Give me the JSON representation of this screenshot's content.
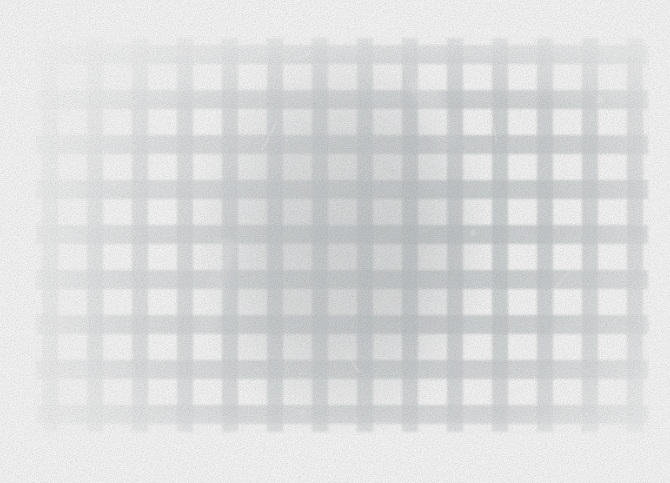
{
  "image": {
    "kind": "photograph",
    "subject": "faded overexposed photograph of a lattice / gingham grid with a large dark circular form behind it",
    "width": 670,
    "height": 483,
    "background_color": "#ffffff",
    "overall_tone": "very high-key, bleached, low contrast",
    "alt_text": "Heavily faded photograph showing a pale grey checkered lattice grid over a large soft dark circle"
  },
  "palette": {
    "paper": "#fdfdfd",
    "bar": "#b9bec1",
    "bar_light": "#dfe2e4",
    "blob_core": "#9ba0a3",
    "blob_edge": "#cdd1d4",
    "highlight": "#ffffff"
  },
  "blob": {
    "name": "dark-circular-form",
    "center_x": 340,
    "center_y": 238,
    "radius_x": 160,
    "radius_y": 205,
    "opacity": 0.62
  },
  "lattice": {
    "bar_color": "#b9bec1",
    "bar_opacity": 0.72,
    "vertical": {
      "count": 14,
      "start_x": 42,
      "period": 45,
      "width": 16,
      "top": 38,
      "bottom": 432
    },
    "horizontal": {
      "count": 9,
      "start_y": 45,
      "period": 45,
      "height": 19,
      "left": 36,
      "right": 648
    }
  },
  "crop": {
    "left": 34,
    "right": 650,
    "top": 36,
    "bottom": 434
  },
  "artifacts": {
    "streaks": [
      {
        "name": "diagonal-emulsion-streak",
        "x": 430,
        "y": 72,
        "width": 26,
        "height": 120,
        "rotate": -24,
        "opacity": 0.5
      },
      {
        "name": "diagonal-emulsion-streak",
        "x": 203,
        "y": 238,
        "width": 18,
        "height": 150,
        "rotate": 12,
        "opacity": 0.42
      }
    ],
    "scratches": [
      {
        "name": "scratch",
        "x": 108,
        "y": 150,
        "width": 2,
        "height": 40,
        "rotate": -18,
        "opacity": 0.5
      },
      {
        "name": "scratch",
        "x": 268,
        "y": 122,
        "width": 2,
        "height": 30,
        "rotate": 28,
        "opacity": 0.45
      },
      {
        "name": "scratch",
        "x": 492,
        "y": 108,
        "width": 2,
        "height": 34,
        "rotate": -12,
        "opacity": 0.45
      },
      {
        "name": "scratch",
        "x": 560,
        "y": 268,
        "width": 2,
        "height": 26,
        "rotate": 40,
        "opacity": 0.4
      },
      {
        "name": "scratch",
        "x": 352,
        "y": 352,
        "width": 2,
        "height": 22,
        "rotate": -34,
        "opacity": 0.4
      }
    ],
    "specks": [
      {
        "name": "dust-speck",
        "x": 596,
        "y": 96,
        "size": 7,
        "opacity": 0.62
      },
      {
        "name": "dust-speck",
        "x": 572,
        "y": 160,
        "size": 9,
        "opacity": 0.58
      },
      {
        "name": "dust-speck",
        "x": 170,
        "y": 80,
        "size": 5,
        "opacity": 0.5
      },
      {
        "name": "dust-speck",
        "x": 470,
        "y": 230,
        "size": 6,
        "opacity": 0.5
      },
      {
        "name": "dust-speck",
        "x": 300,
        "y": 410,
        "size": 5,
        "opacity": 0.45
      }
    ]
  }
}
